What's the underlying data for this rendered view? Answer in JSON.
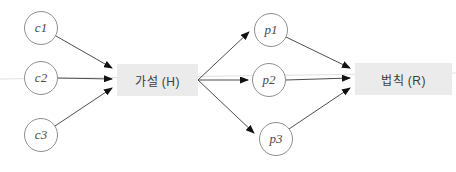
{
  "diagram": {
    "hypothesis_box": {
      "label": "가설 (H)"
    },
    "law_box": {
      "label": "법칙 (R)"
    },
    "cause_nodes": [
      {
        "label": "c1"
      },
      {
        "label": "c2"
      },
      {
        "label": "c3"
      }
    ],
    "prediction_nodes": [
      {
        "label": "p1"
      },
      {
        "label": "p2"
      },
      {
        "label": "p3"
      }
    ],
    "colors": {
      "box_fill": "#ebebeb",
      "box_text": "#3c3c3c",
      "circle_border": "#8f8f8f",
      "circle_text": "#4a4a4a",
      "arrow_line": "#4d4d4d",
      "arrowhead": "#111111",
      "faint_rule": "#e0e0e0"
    }
  }
}
